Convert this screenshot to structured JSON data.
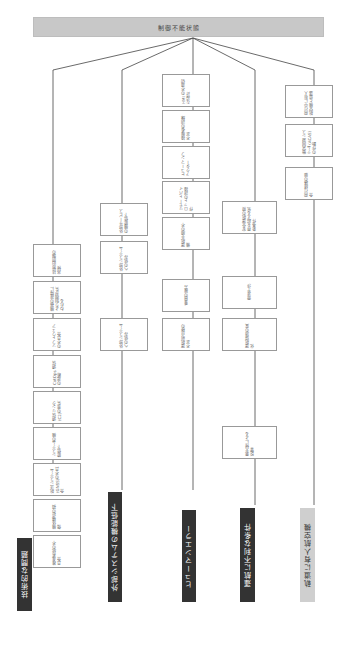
{
  "root": {
    "title": "制御不能状態"
  },
  "categories": [
    {
      "label": "技術的な問題",
      "style": "dark"
    },
    {
      "label": "外部システムの機能低下",
      "style": "dark"
    },
    {
      "label": "ヒューマンエラー",
      "style": "dark"
    },
    {
      "label": "運航に不利な条件",
      "style": "dark"
    },
    {
      "label": "軌道に有人航空機",
      "style": "gray"
    }
  ],
  "boxes": {
    "tech": [
      "技術的問題の兆候",
      "機器の故障により制御が失われる",
      "ソフトウェアの不具合",
      "CotOps 通信の遮断",
      "通信リンク(C2)の喪失",
      "システムの機能低下",
      "航法システム(GNSS)の不具合",
      "機体構造の損傷",
      "推進系統の不具合"
    ],
    "external": [
      "外部サービスの機能低下",
      "外部システムへの依存"
    ],
    "human": [
      "HMI の不適切な設計",
      "操縦者の訓練不足",
      "ヒューマンファクター",
      "リモートパイロットの誤操作",
      "運航手順の不備",
      "乗員の疲労",
      "運航前点検の不足"
    ],
    "conditions": [
      "安全運航の限界を超える気象条件",
      "電波干渉",
      "運航環境の変化",
      "悪天候による影響"
    ],
    "manned": [
      "飛行中に有人航空機と遭遇",
      "衝突回避システム (ACAS) の作動",
      "飛行経路の競合"
    ]
  }
}
